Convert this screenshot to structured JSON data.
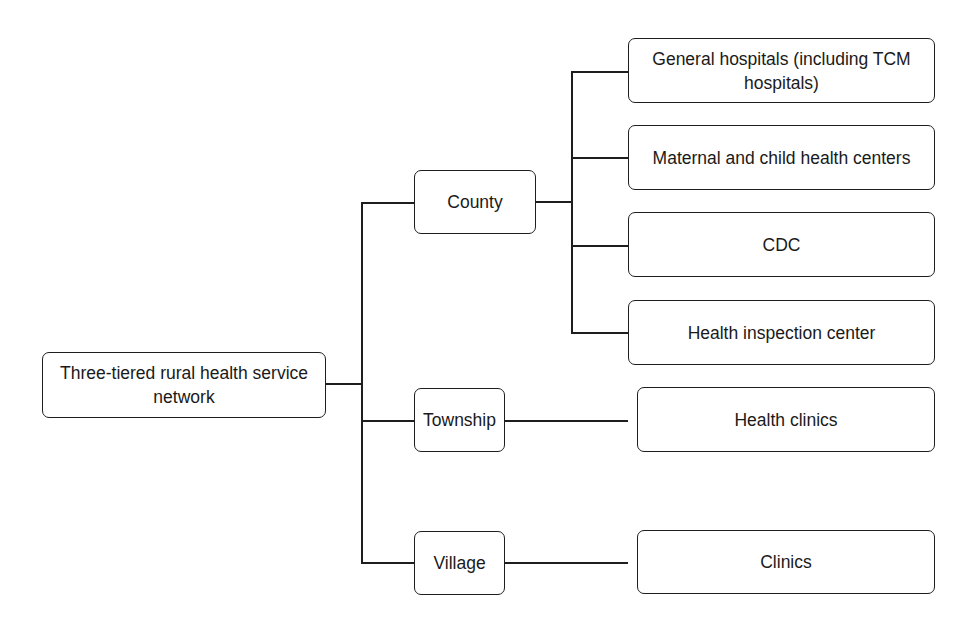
{
  "diagram": {
    "type": "tree",
    "root": {
      "label": "Three-tiered rural health service network"
    },
    "tiers": [
      {
        "label": "County",
        "children": [
          {
            "label": "General hospitals (including TCM hospitals)"
          },
          {
            "label": "Maternal and child health centers"
          },
          {
            "label": "CDC"
          },
          {
            "label": "Health inspection center"
          }
        ]
      },
      {
        "label": "Township",
        "children": [
          {
            "label": "Health clinics"
          }
        ]
      },
      {
        "label": "Village",
        "children": [
          {
            "label": "Clinics"
          }
        ]
      }
    ],
    "colors": {
      "stroke": "#1e1e1e",
      "background": "#ffffff",
      "text": "#1a1a1a"
    }
  }
}
